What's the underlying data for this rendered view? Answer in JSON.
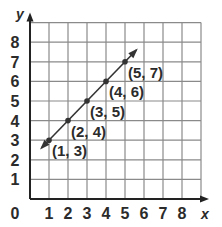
{
  "chart_data": {
    "type": "line",
    "title": "",
    "xlabel": "x",
    "ylabel": "y",
    "xlim": [
      0,
      9
    ],
    "ylim": [
      0,
      9
    ],
    "grid": true,
    "x_ticks": [
      "1",
      "2",
      "3",
      "4",
      "5",
      "6",
      "7",
      "8"
    ],
    "y_ticks": [
      "1",
      "2",
      "3",
      "4",
      "5",
      "6",
      "7",
      "8"
    ],
    "origin_label": "0",
    "line": {
      "equation": "y = x + 2",
      "extends_both_directions": true,
      "x_range": [
        0.6,
        5.6
      ]
    },
    "series": [
      {
        "name": "y = x + 2",
        "points": [
          {
            "x": 1,
            "y": 3,
            "label": "(1, 3)"
          },
          {
            "x": 2,
            "y": 4,
            "label": "(2, 4)"
          },
          {
            "x": 3,
            "y": 5,
            "label": "(3, 5)"
          },
          {
            "x": 4,
            "y": 6,
            "label": "(4, 6)"
          },
          {
            "x": 5,
            "y": 7,
            "label": "(5, 7)"
          }
        ]
      }
    ],
    "legend": null
  },
  "colors": {
    "grid": "#8a8a8a",
    "axis": "#222222",
    "line": "#333333",
    "text": "#2b2b2b"
  }
}
